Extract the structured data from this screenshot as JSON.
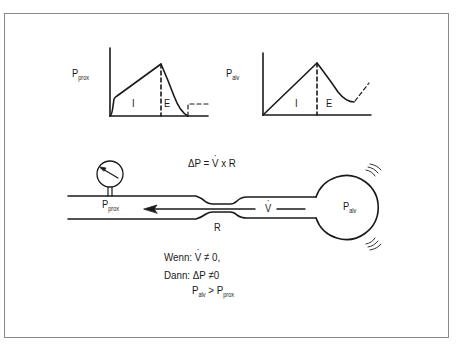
{
  "figure": {
    "graph_proximal": {
      "ylabel_main": "P",
      "ylabel_sub": "prox",
      "phase_inspiration": "I",
      "phase_expiration": "E"
    },
    "graph_alveolar": {
      "ylabel_main": "P",
      "ylabel_sub": "alv",
      "phase_inspiration": "I",
      "phase_expiration": "E"
    },
    "model": {
      "formula_delta": "ΔP = ",
      "formula_v": "V",
      "formula_rest": " x R",
      "gauge_label_main": "P",
      "gauge_label_sub": "prox",
      "flow_label": "V",
      "resistance_label": "R",
      "alveolus_label_main": "P",
      "alveolus_label_sub": "alv"
    },
    "condition": {
      "line1_prefix": "Wenn: ",
      "line1_v": "V",
      "line1_suffix": " ≠ 0,",
      "line2": "Dann: ΔP ≠0",
      "line3_a_main": "P",
      "line3_a_sub": "alv",
      "line3_op": " > ",
      "line3_b_main": "P",
      "line3_b_sub": "prox"
    },
    "colors": {
      "line": "#1a1a1a",
      "frame": "#8a8a8a",
      "background": "#ffffff"
    }
  }
}
